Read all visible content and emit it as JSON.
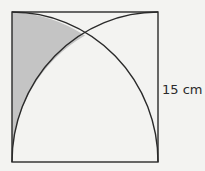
{
  "diagram": {
    "side_label": "15 cm",
    "colors": {
      "background": "#f3f3f1",
      "stroke": "#2a2a2a",
      "shaded": "#c4c4c4"
    }
  }
}
